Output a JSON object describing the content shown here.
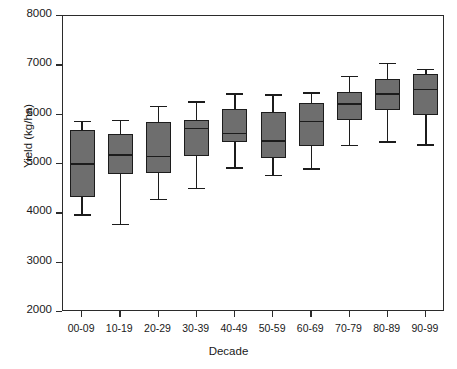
{
  "chart_data": {
    "type": "box",
    "title": "",
    "xlabel": "Decade",
    "ylabel": "Yield (kg/ha)",
    "ylim": [
      2000,
      8000
    ],
    "yticks": [
      2000,
      3000,
      4000,
      5000,
      6000,
      7000,
      8000
    ],
    "ytick_labels": [
      "2000",
      "3000",
      "4000",
      "5000",
      "6000",
      "7000",
      "8000"
    ],
    "grid": false,
    "legend": null,
    "box_fill_color": "#6e6e6e",
    "box_line_color": "#1c1c1c",
    "categories": [
      "00-09",
      "10-19",
      "20-29",
      "30-39",
      "40-49",
      "50-59",
      "60-69",
      "70-79",
      "80-89",
      "90-99"
    ],
    "boxes": [
      {
        "category": "00-09",
        "whisker_low": 3980,
        "q1": 4340,
        "median": 5000,
        "q3": 5690,
        "whisker_high": 5880
      },
      {
        "category": "10-19",
        "whisker_low": 3790,
        "q1": 4790,
        "median": 5190,
        "q3": 5610,
        "whisker_high": 5900
      },
      {
        "category": "20-29",
        "whisker_low": 4290,
        "q1": 4810,
        "median": 5150,
        "q3": 5850,
        "whisker_high": 6180
      },
      {
        "category": "30-39",
        "whisker_low": 4510,
        "q1": 5160,
        "median": 5720,
        "q3": 5900,
        "whisker_high": 6270
      },
      {
        "category": "40-49",
        "whisker_low": 4930,
        "q1": 5440,
        "median": 5620,
        "q3": 6120,
        "whisker_high": 6430
      },
      {
        "category": "50-59",
        "whisker_low": 4780,
        "q1": 5130,
        "median": 5460,
        "q3": 6050,
        "whisker_high": 6410
      },
      {
        "category": "60-69",
        "whisker_low": 4910,
        "q1": 5370,
        "median": 5860,
        "q3": 6240,
        "whisker_high": 6450
      },
      {
        "category": "70-79",
        "whisker_low": 5390,
        "q1": 5900,
        "median": 6210,
        "q3": 6450,
        "whisker_high": 6780
      },
      {
        "category": "80-89",
        "whisker_low": 5460,
        "q1": 6100,
        "median": 6420,
        "q3": 6730,
        "whisker_high": 7050
      },
      {
        "category": "90-99",
        "whisker_low": 5400,
        "q1": 6000,
        "median": 6510,
        "q3": 6820,
        "whisker_high": 6930
      }
    ]
  }
}
